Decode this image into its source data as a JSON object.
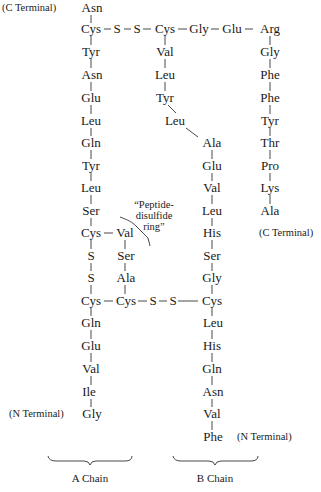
{
  "labels": {
    "a_chain": "A Chain",
    "b_chain": "B Chain",
    "c_terminal": "(C Terminal)",
    "n_terminal": "(N Terminal)",
    "ring_note_line1": "“Peptide-",
    "ring_note_line2": "disulfide",
    "ring_note_line3": "ring”"
  },
  "a_chain": {
    "main": [
      "Asn",
      "Cys",
      "Tyr",
      "Asn",
      "Glu",
      "Leu",
      "Gln",
      "Tyr",
      "Leu",
      "Ser",
      "Cys",
      "S",
      "S",
      "Cys",
      "Gln",
      "Glu",
      "Val",
      "Ile",
      "Gly"
    ],
    "ring_branch": [
      "Val",
      "Ser",
      "Ala",
      "Cys"
    ]
  },
  "b_chain": {
    "top_branch": [
      "Cys",
      "Val",
      "Leu",
      "Tyr",
      "Leu"
    ],
    "main": [
      "Ala",
      "Glu",
      "Val",
      "Leu",
      "His",
      "Ser",
      "Gly",
      "Cys",
      "Leu",
      "His",
      "Gln",
      "Asn",
      "Val",
      "Phe"
    ],
    "right_branch": [
      "Arg",
      "Gly",
      "Phe",
      "Phe",
      "Tyr",
      "Thr",
      "Pro",
      "Lys",
      "Ala"
    ],
    "top_link": [
      "Gly",
      "Glu"
    ]
  },
  "bridges": {
    "top": [
      "S",
      "S"
    ],
    "bottom": [
      "S",
      "S"
    ]
  }
}
